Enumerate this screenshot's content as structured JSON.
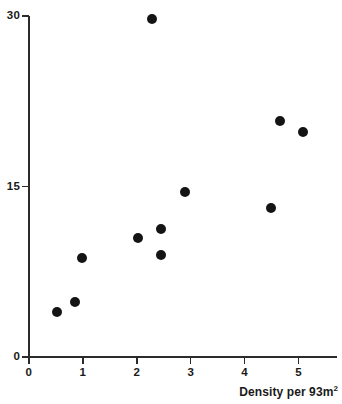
{
  "chart_data": {
    "type": "scatter",
    "title": "",
    "xlabel": "Density per 93m",
    "xlabel_sup": "2",
    "ylabel": "",
    "xlim": [
      0,
      5.6
    ],
    "ylim": [
      0,
      30
    ],
    "grid": false,
    "legend": null,
    "x_ticks": [
      "0",
      "1",
      "2",
      "3",
      "4",
      "5"
    ],
    "x_tick_values": [
      0,
      1,
      2,
      3,
      4,
      5
    ],
    "y_ticks": [
      "0",
      "15",
      "30"
    ],
    "y_tick_values": [
      0,
      15,
      30
    ],
    "marker": {
      "shape": "circle",
      "color": "#141414",
      "size_px": 10
    },
    "points": [
      {
        "x": 0.53,
        "y": 4.0
      },
      {
        "x": 0.85,
        "y": 4.8
      },
      {
        "x": 0.98,
        "y": 8.7
      },
      {
        "x": 2.02,
        "y": 10.5
      },
      {
        "x": 2.29,
        "y": 29.7
      },
      {
        "x": 2.45,
        "y": 11.3
      },
      {
        "x": 2.45,
        "y": 9.0
      },
      {
        "x": 2.89,
        "y": 14.5
      },
      {
        "x": 4.49,
        "y": 13.1
      },
      {
        "x": 4.65,
        "y": 20.8
      },
      {
        "x": 5.09,
        "y": 19.8
      }
    ]
  },
  "colors": {
    "axis": "#2b2b2b",
    "marker": "#141414",
    "text": "#1a1a1a",
    "background": "#ffffff"
  }
}
